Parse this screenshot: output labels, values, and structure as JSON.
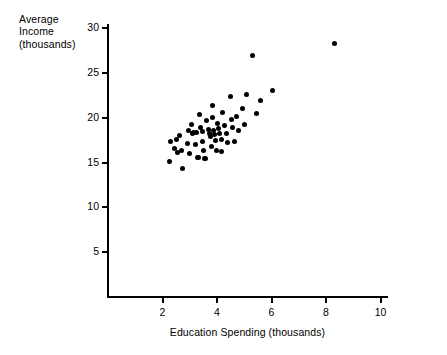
{
  "chart_data": {
    "type": "scatter",
    "title": "",
    "xlabel": "Education Spending (thousands)",
    "ylabel": "Average Income (thousands)",
    "ylabel_lines": [
      "Average",
      "Income",
      "(thousands)"
    ],
    "xlim": [
      0,
      10.2
    ],
    "ylim": [
      0,
      30.5
    ],
    "xticks": [
      2,
      4,
      6,
      8,
      10
    ],
    "yticks": [
      5,
      10,
      15,
      20,
      25,
      30
    ],
    "grid": false,
    "legend": null,
    "marker": "filled-circle",
    "marker_color": "#000000",
    "points": [
      {
        "x": 2.25,
        "y": 15.1
      },
      {
        "x": 2.3,
        "y": 17.3
      },
      {
        "x": 2.45,
        "y": 16.6
      },
      {
        "x": 2.5,
        "y": 17.6
      },
      {
        "x": 2.55,
        "y": 16.1
      },
      {
        "x": 2.62,
        "y": 18.0
      },
      {
        "x": 2.7,
        "y": 16.4
      },
      {
        "x": 2.75,
        "y": 14.3
      },
      {
        "x": 2.9,
        "y": 17.1
      },
      {
        "x": 2.95,
        "y": 18.6
      },
      {
        "x": 3.0,
        "y": 16.0
      },
      {
        "x": 3.05,
        "y": 19.2
      },
      {
        "x": 3.1,
        "y": 18.3
      },
      {
        "x": 3.15,
        "y": 18.4
      },
      {
        "x": 3.2,
        "y": 17.0
      },
      {
        "x": 3.25,
        "y": 18.4
      },
      {
        "x": 3.28,
        "y": 15.6
      },
      {
        "x": 3.32,
        "y": 15.6
      },
      {
        "x": 3.35,
        "y": 20.4
      },
      {
        "x": 3.4,
        "y": 18.9
      },
      {
        "x": 3.45,
        "y": 18.5
      },
      {
        "x": 3.48,
        "y": 17.3
      },
      {
        "x": 3.52,
        "y": 16.4
      },
      {
        "x": 3.55,
        "y": 15.5
      },
      {
        "x": 3.58,
        "y": 15.5
      },
      {
        "x": 3.62,
        "y": 19.7
      },
      {
        "x": 3.68,
        "y": 18.7
      },
      {
        "x": 3.72,
        "y": 18.2
      },
      {
        "x": 3.75,
        "y": 17.9
      },
      {
        "x": 3.78,
        "y": 16.8
      },
      {
        "x": 3.82,
        "y": 21.4
      },
      {
        "x": 3.85,
        "y": 20.0
      },
      {
        "x": 3.88,
        "y": 18.6
      },
      {
        "x": 3.92,
        "y": 18.1
      },
      {
        "x": 3.95,
        "y": 17.5
      },
      {
        "x": 3.98,
        "y": 16.3
      },
      {
        "x": 4.02,
        "y": 19.4
      },
      {
        "x": 4.05,
        "y": 18.8
      },
      {
        "x": 4.1,
        "y": 18.2
      },
      {
        "x": 4.15,
        "y": 17.6
      },
      {
        "x": 4.18,
        "y": 16.2
      },
      {
        "x": 4.22,
        "y": 20.6
      },
      {
        "x": 4.28,
        "y": 19.1
      },
      {
        "x": 4.35,
        "y": 18.3
      },
      {
        "x": 4.4,
        "y": 17.2
      },
      {
        "x": 4.48,
        "y": 22.4
      },
      {
        "x": 4.52,
        "y": 19.8
      },
      {
        "x": 4.58,
        "y": 18.9
      },
      {
        "x": 4.65,
        "y": 17.4
      },
      {
        "x": 4.72,
        "y": 20.1
      },
      {
        "x": 4.8,
        "y": 18.6
      },
      {
        "x": 4.92,
        "y": 21.0
      },
      {
        "x": 5.0,
        "y": 19.3
      },
      {
        "x": 5.1,
        "y": 22.6
      },
      {
        "x": 5.3,
        "y": 27.0
      },
      {
        "x": 5.45,
        "y": 20.5
      },
      {
        "x": 5.6,
        "y": 21.9
      },
      {
        "x": 6.05,
        "y": 23.1
      },
      {
        "x": 8.3,
        "y": 28.3
      }
    ]
  },
  "axis": {
    "yticklabels": [
      "30",
      "25",
      "20",
      "15",
      "10",
      "5"
    ],
    "xticklabels": [
      "2",
      "4",
      "6",
      "8",
      "10"
    ]
  }
}
